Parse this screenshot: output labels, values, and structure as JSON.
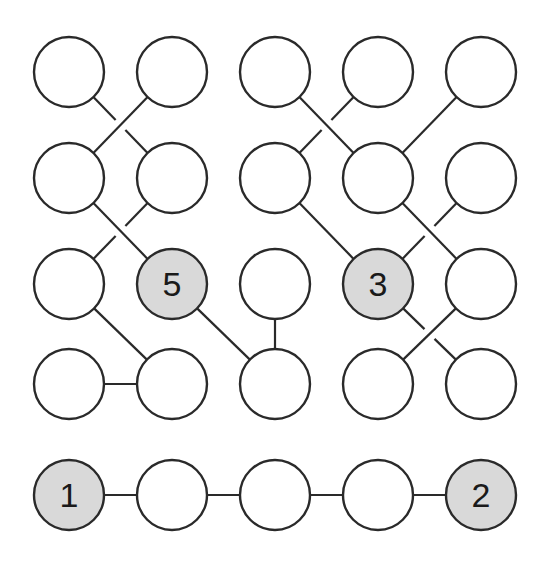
{
  "puzzle": {
    "title": "",
    "node_radius": 35,
    "colors": {
      "background": "#ffffff",
      "stroke": "#2a2a2a",
      "empty_fill": "#ffffff",
      "given_fill": "#d9d9d9",
      "label": "#1a1a1a"
    },
    "columns_x": [
      69,
      172,
      275,
      378,
      481
    ],
    "rows_y": [
      72,
      178,
      284,
      384
    ],
    "bottom_row_y": 495,
    "nodes": [
      {
        "id": "r0c0",
        "row": 0,
        "col": 0,
        "label": ""
      },
      {
        "id": "r0c1",
        "row": 0,
        "col": 1,
        "label": ""
      },
      {
        "id": "r0c2",
        "row": 0,
        "col": 2,
        "label": ""
      },
      {
        "id": "r0c3",
        "row": 0,
        "col": 3,
        "label": ""
      },
      {
        "id": "r0c4",
        "row": 0,
        "col": 4,
        "label": ""
      },
      {
        "id": "r1c0",
        "row": 1,
        "col": 0,
        "label": ""
      },
      {
        "id": "r1c1",
        "row": 1,
        "col": 1,
        "label": ""
      },
      {
        "id": "r1c2",
        "row": 1,
        "col": 2,
        "label": ""
      },
      {
        "id": "r1c3",
        "row": 1,
        "col": 3,
        "label": ""
      },
      {
        "id": "r1c4",
        "row": 1,
        "col": 4,
        "label": ""
      },
      {
        "id": "r2c0",
        "row": 2,
        "col": 0,
        "label": ""
      },
      {
        "id": "r2c1",
        "row": 2,
        "col": 1,
        "label": "5"
      },
      {
        "id": "r2c2",
        "row": 2,
        "col": 2,
        "label": ""
      },
      {
        "id": "r2c3",
        "row": 2,
        "col": 3,
        "label": "3"
      },
      {
        "id": "r2c4",
        "row": 2,
        "col": 4,
        "label": ""
      },
      {
        "id": "r3c0",
        "row": 3,
        "col": 0,
        "label": ""
      },
      {
        "id": "r3c1",
        "row": 3,
        "col": 1,
        "label": ""
      },
      {
        "id": "r3c2",
        "row": 3,
        "col": 2,
        "label": ""
      },
      {
        "id": "r3c3",
        "row": 3,
        "col": 3,
        "label": ""
      },
      {
        "id": "r3c4",
        "row": 3,
        "col": 4,
        "label": ""
      },
      {
        "id": "b0",
        "row": "bottom",
        "col": 0,
        "label": "1"
      },
      {
        "id": "b1",
        "row": "bottom",
        "col": 1,
        "label": ""
      },
      {
        "id": "b2",
        "row": "bottom",
        "col": 2,
        "label": ""
      },
      {
        "id": "b3",
        "row": "bottom",
        "col": 3,
        "label": ""
      },
      {
        "id": "b4",
        "row": "bottom",
        "col": 4,
        "label": "2"
      }
    ],
    "edges": [
      {
        "from": "r0c0",
        "to": "r1c1",
        "gap": true
      },
      {
        "from": "r0c1",
        "to": "r1c0",
        "gap": false
      },
      {
        "from": "r1c0",
        "to": "r2c1",
        "gap": false
      },
      {
        "from": "r1c1",
        "to": "r2c0",
        "gap": true
      },
      {
        "from": "r2c0",
        "to": "r3c1",
        "gap": false
      },
      {
        "from": "r3c0",
        "to": "r3c1",
        "gap": false
      },
      {
        "from": "r2c1",
        "to": "r3c2",
        "gap": false
      },
      {
        "from": "r2c2",
        "to": "r3c2",
        "gap": false
      },
      {
        "from": "r0c2",
        "to": "r1c3",
        "gap": false
      },
      {
        "from": "r0c3",
        "to": "r1c2",
        "gap": true
      },
      {
        "from": "r0c4",
        "to": "r1c3",
        "gap": false
      },
      {
        "from": "r1c2",
        "to": "r2c3",
        "gap": false
      },
      {
        "from": "r1c3",
        "to": "r2c4",
        "gap": false
      },
      {
        "from": "r1c4",
        "to": "r2c3",
        "gap": true
      },
      {
        "from": "r2c3",
        "to": "r3c4",
        "gap": true
      },
      {
        "from": "r2c4",
        "to": "r3c3",
        "gap": false
      },
      {
        "from": "b0",
        "to": "b1",
        "gap": false
      },
      {
        "from": "b1",
        "to": "b2",
        "gap": false
      },
      {
        "from": "b2",
        "to": "b3",
        "gap": false
      },
      {
        "from": "b3",
        "to": "b4",
        "gap": false
      }
    ]
  }
}
